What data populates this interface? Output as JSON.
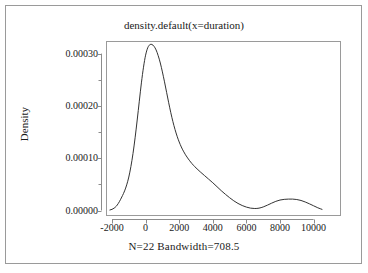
{
  "chart_data": {
    "type": "line",
    "title": "density.default(x=duration)",
    "subtitle": "N=22   Bandwidth=708.5",
    "xlabel": "",
    "ylabel": "Density",
    "xlim": [
      -2900,
      11200
    ],
    "ylim": [
      -6.5e-06,
      0.000335
    ],
    "grid": false,
    "legend": null,
    "x_ticks": [
      {
        "value": -2000,
        "label": "-2000"
      },
      {
        "value": 0,
        "label": "0"
      },
      {
        "value": 2000,
        "label": "2000"
      },
      {
        "value": 4000,
        "label": "4000"
      },
      {
        "value": 6000,
        "label": "6000"
      },
      {
        "value": 8000,
        "label": "8000"
      },
      {
        "value": 10000,
        "label": "10000"
      }
    ],
    "y_ticks": [
      {
        "value": 0.0,
        "label": "0.00000"
      },
      {
        "value": 0.0001,
        "label": "0.00010"
      },
      {
        "value": 0.0002,
        "label": "0.00020"
      },
      {
        "value": 0.0003,
        "label": "0.00030"
      }
    ],
    "y_minor_ticks": [
      5e-05,
      0.00015,
      0.00025
    ],
    "series": [
      {
        "name": "density",
        "color": "#333333",
        "x": [
          -2125,
          -2000,
          -1875,
          -1750,
          -1625,
          -1500,
          -1375,
          -1250,
          -1125,
          -1000,
          -875,
          -750,
          -625,
          -500,
          -375,
          -250,
          -125,
          0,
          125,
          250,
          375,
          500,
          625,
          750,
          875,
          1000,
          1125,
          1250,
          1375,
          1500,
          1625,
          1750,
          1875,
          2000,
          2125,
          2250,
          2375,
          2500,
          2625,
          2750,
          2875,
          3000,
          3250,
          3500,
          3750,
          4000,
          4250,
          4500,
          4750,
          5000,
          5250,
          5500,
          5750,
          6000,
          6250,
          6500,
          6750,
          7000,
          7250,
          7500,
          7750,
          8000,
          8250,
          8500,
          8750,
          9000,
          9250,
          9500,
          9750,
          10000,
          10250,
          10500
        ],
        "y": [
          1e-06,
          2.2e-06,
          4.5e-06,
          8e-06,
          1.35e-05,
          2.05e-05,
          2.85e-05,
          3.75e-05,
          4.9e-05,
          6.4e-05,
          8.4e-05,
          0.000109,
          0.000139,
          0.000173,
          0.000209,
          0.000244,
          0.000274,
          0.000297,
          0.000311,
          0.000317,
          0.0003175,
          0.000314,
          0.000307,
          0.000296,
          0.000282,
          0.000265,
          0.000246,
          0.000226,
          0.000206,
          0.000187,
          0.00017,
          0.000155,
          0.000142,
          0.000131,
          0.0001215,
          0.0001135,
          0.0001065,
          0.0001005,
          9.5e-05,
          9e-05,
          8.55e-05,
          8.15e-05,
          7.4e-05,
          6.7e-05,
          6e-05,
          5.3e-05,
          4.55e-05,
          3.8e-05,
          3.1e-05,
          2.45e-05,
          1.85e-05,
          1.35e-05,
          9.5e-06,
          6.5e-06,
          4.5e-06,
          3.8e-06,
          4.5e-06,
          6.8e-06,
          1.02e-05,
          1.4e-05,
          1.75e-05,
          2e-05,
          2.13e-05,
          2.18e-05,
          2.18e-05,
          2.1e-05,
          1.92e-05,
          1.63e-05,
          1.28e-05,
          9e-06,
          5.2e-06,
          2.2e-06
        ]
      }
    ],
    "annotations": []
  },
  "figure": {
    "background_color": "#ffffff",
    "frame_color": "#9a9a9a",
    "axis_color": "#8c8c8c",
    "text_color": "#1a1a1a"
  }
}
